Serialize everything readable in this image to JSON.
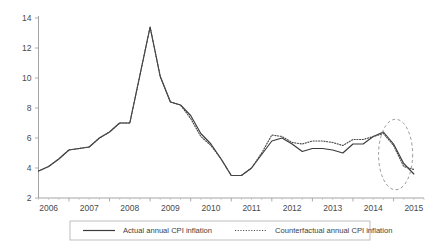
{
  "chart_data": {
    "type": "line",
    "title": "",
    "xlabel": "",
    "ylabel": "",
    "ylim": [
      2,
      14
    ],
    "xlim": [
      2005.75,
      2015.25
    ],
    "grid": false,
    "legend_position": "bottom",
    "ytick_labels": [
      "2",
      "4",
      "6",
      "8",
      "10",
      "12",
      "14"
    ],
    "ytick_values": [
      2,
      4,
      6,
      8,
      10,
      12,
      14
    ],
    "xtick_labels": [
      "2006",
      "2007",
      "2008",
      "2009",
      "2010",
      "2011",
      "2012",
      "2013",
      "2014",
      "2015"
    ],
    "xtick_values": [
      2006,
      2007,
      2008,
      2009,
      2010,
      2011,
      2012,
      2013,
      2014,
      2015
    ],
    "x": [
      2005.75,
      2006.0,
      2006.25,
      2006.5,
      2006.75,
      2007.0,
      2007.25,
      2007.5,
      2007.75,
      2008.0,
      2008.25,
      2008.5,
      2008.75,
      2009.0,
      2009.25,
      2009.5,
      2009.75,
      2010.0,
      2010.25,
      2010.5,
      2010.75,
      2011.0,
      2011.25,
      2011.5,
      2011.75,
      2012.0,
      2012.25,
      2012.5,
      2012.75,
      2013.0,
      2013.25,
      2013.5,
      2013.75,
      2014.0,
      2014.25,
      2014.5,
      2014.75,
      2015.0
    ],
    "series": [
      {
        "name": "Actual annual CPI inflation",
        "style": "solid",
        "color": "#3b3b3b",
        "values": [
          3.8,
          4.1,
          4.6,
          5.2,
          5.3,
          5.4,
          6.0,
          6.4,
          7.0,
          7.0,
          10.2,
          13.4,
          10.1,
          8.4,
          8.2,
          7.5,
          6.3,
          5.6,
          4.6,
          3.5,
          3.5,
          4.0,
          4.9,
          5.8,
          6.0,
          5.6,
          5.1,
          5.3,
          5.3,
          5.2,
          5.0,
          5.6,
          5.6,
          6.1,
          6.4,
          5.6,
          4.3,
          3.6
        ]
      },
      {
        "name": "Counterfactual annual CPI inflation",
        "style": "dotted",
        "color": "#4a4a4a",
        "values": [
          3.8,
          4.1,
          4.6,
          5.2,
          5.3,
          5.4,
          6.0,
          6.4,
          7.0,
          7.0,
          10.2,
          13.4,
          10.1,
          8.4,
          8.2,
          7.3,
          6.1,
          5.5,
          4.6,
          3.5,
          3.5,
          4.0,
          5.0,
          6.2,
          6.1,
          5.7,
          5.6,
          5.8,
          5.8,
          5.7,
          5.5,
          5.9,
          5.9,
          6.1,
          6.3,
          5.5,
          4.1,
          3.9
        ]
      }
    ],
    "annotations": [
      {
        "kind": "ellipse",
        "name": "highlight-ellipse",
        "style": "dashed",
        "center_x": 2014.55,
        "center_y": 4.9,
        "radius_x": 0.42,
        "radius_y": 2.35
      }
    ],
    "legend": [
      {
        "label": "Actual annual CPI inflation",
        "style": "solid"
      },
      {
        "label": "Counterfactual annual CPI inflation",
        "style": "dotted"
      }
    ]
  },
  "colors": {
    "actual": "#3b3b3b",
    "counterfactual": "#4a4a4a",
    "axis": "#9a9a9a",
    "annotation": "#8d8d8d",
    "background": "#ffffff"
  }
}
